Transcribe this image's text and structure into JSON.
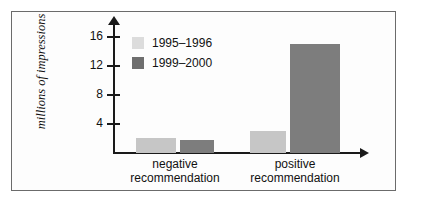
{
  "chart_data": {
    "type": "bar",
    "title": "",
    "subtitle": "",
    "xlabel": "",
    "ylabel": "millions of impressions",
    "categories": [
      "negative recommendation",
      "positive recommendation"
    ],
    "category_lines": [
      [
        "negative",
        "recommendation"
      ],
      [
        "positive",
        "recommendation"
      ]
    ],
    "series": [
      {
        "name": "1995–1996",
        "color": "#c6c6c6",
        "values": [
          2.0,
          3.0
        ]
      },
      {
        "name": "1999–2000",
        "color": "#7d7d7d",
        "values": [
          1.8,
          15.0
        ]
      }
    ],
    "ylim": [
      0,
      17.5
    ],
    "yticks": [
      4,
      8,
      12,
      16
    ],
    "ytick_labels": [
      "4",
      "8",
      "12",
      "16"
    ],
    "grid": false,
    "legend_position": "upper-left-inside",
    "axis_style": "arrow-tipped L-axes",
    "axis_color": "#1a1a1a"
  },
  "legend": {
    "items": [
      {
        "label": "1995–1996",
        "swatch": "light-gray-swatch"
      },
      {
        "label": "1999–2000",
        "swatch": "dark-gray-swatch"
      }
    ]
  },
  "colors": {
    "series_light": "#c6c6c6",
    "series_dark": "#7d7d7d",
    "legend_light": "#dcdcdc",
    "legend_dark": "#6e6e6e",
    "axis": "#1a1a1a",
    "frame_border": "#6b6b6b",
    "background": "#ffffff"
  }
}
